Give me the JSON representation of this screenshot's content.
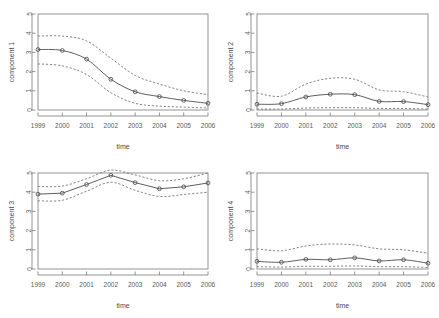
{
  "figure": {
    "layout": "2x2 grid of time-series panels",
    "background_color": "#ffffff",
    "line_color": "#555555",
    "band_color": "#666666",
    "frame_color": "#888888",
    "marker_color": "#4d4d4d"
  },
  "chart_data": [
    {
      "type": "line",
      "title": "",
      "xlabel": "time",
      "ylabel": "component 1",
      "categories": [
        "1999",
        "2000",
        "2001",
        "2002",
        "2003",
        "2004",
        "2005",
        "2006"
      ],
      "x": [
        1999,
        2000,
        2001,
        2002,
        2003,
        2004,
        2005,
        2006
      ],
      "xlim": [
        1999,
        2006
      ],
      "ylim": [
        0,
        5
      ],
      "yticks": [
        0,
        1,
        2,
        3,
        4,
        5
      ],
      "grid": false,
      "legend": "none",
      "series": [
        {
          "name": "estimate",
          "style": "solid-with-circles",
          "values": [
            3.15,
            3.1,
            2.65,
            1.6,
            0.95,
            0.7,
            0.5,
            0.35
          ]
        },
        {
          "name": "upper band",
          "style": "dashed",
          "values": [
            3.85,
            3.85,
            3.6,
            2.7,
            1.8,
            1.35,
            1.0,
            0.8
          ]
        },
        {
          "name": "lower band",
          "style": "dashed",
          "values": [
            2.4,
            2.3,
            1.85,
            0.9,
            0.35,
            0.2,
            0.15,
            0.1
          ]
        }
      ]
    },
    {
      "type": "line",
      "title": "",
      "xlabel": "time",
      "ylabel": "component 2",
      "categories": [
        "1999",
        "2000",
        "2001",
        "2002",
        "2003",
        "2004",
        "2005",
        "2006"
      ],
      "x": [
        1999,
        2000,
        2001,
        2002,
        2003,
        2004,
        2005,
        2006
      ],
      "xlim": [
        1999,
        2006
      ],
      "ylim": [
        0,
        5
      ],
      "yticks": [
        0,
        1,
        2,
        3,
        4,
        5
      ],
      "grid": false,
      "legend": "none",
      "series": [
        {
          "name": "estimate",
          "style": "solid-with-circles",
          "values": [
            0.3,
            0.33,
            0.68,
            0.82,
            0.8,
            0.45,
            0.44,
            0.28
          ]
        },
        {
          "name": "upper band",
          "style": "dashed",
          "values": [
            0.88,
            0.72,
            1.35,
            1.65,
            1.6,
            1.05,
            0.95,
            0.68
          ]
        },
        {
          "name": "lower band",
          "style": "dashed",
          "values": [
            0.05,
            0.05,
            0.1,
            0.12,
            0.12,
            0.08,
            0.08,
            0.05
          ]
        }
      ]
    },
    {
      "type": "line",
      "title": "",
      "xlabel": "time",
      "ylabel": "component 3",
      "categories": [
        "1999",
        "2000",
        "2001",
        "2002",
        "2003",
        "2004",
        "2005",
        "2006"
      ],
      "x": [
        1999,
        2000,
        2001,
        2002,
        2003,
        2004,
        2005,
        2006
      ],
      "xlim": [
        1999,
        2006
      ],
      "ylim": [
        0,
        5
      ],
      "yticks": [
        0,
        1,
        2,
        3,
        4,
        5
      ],
      "grid": false,
      "legend": "none",
      "series": [
        {
          "name": "estimate",
          "style": "solid-with-circles",
          "values": [
            3.9,
            3.95,
            4.4,
            4.88,
            4.5,
            4.18,
            4.28,
            4.48
          ]
        },
        {
          "name": "upper band",
          "style": "dashed",
          "values": [
            4.3,
            4.32,
            4.7,
            5.15,
            4.9,
            4.6,
            4.7,
            5.0
          ]
        },
        {
          "name": "lower band",
          "style": "dashed",
          "values": [
            3.55,
            3.58,
            4.05,
            4.52,
            4.1,
            3.78,
            3.88,
            4.0
          ]
        }
      ]
    },
    {
      "type": "line",
      "title": "",
      "xlabel": "time",
      "ylabel": "component 4",
      "categories": [
        "1999",
        "2000",
        "2001",
        "2002",
        "2003",
        "2004",
        "2005",
        "2006"
      ],
      "x": [
        1999,
        2000,
        2001,
        2002,
        2003,
        2004,
        2005,
        2006
      ],
      "xlim": [
        1999,
        2006
      ],
      "ylim": [
        0,
        5
      ],
      "yticks": [
        0,
        1,
        2,
        3,
        4,
        5
      ],
      "grid": false,
      "legend": "none",
      "series": [
        {
          "name": "estimate",
          "style": "solid-with-circles",
          "values": [
            0.4,
            0.35,
            0.5,
            0.48,
            0.58,
            0.42,
            0.48,
            0.3
          ]
        },
        {
          "name": "upper band",
          "style": "dashed",
          "values": [
            1.05,
            0.95,
            1.2,
            1.3,
            1.25,
            1.05,
            1.0,
            0.82
          ]
        },
        {
          "name": "lower band",
          "style": "dashed",
          "values": [
            0.12,
            0.1,
            0.14,
            0.14,
            0.16,
            0.12,
            0.12,
            0.08
          ]
        }
      ]
    }
  ]
}
